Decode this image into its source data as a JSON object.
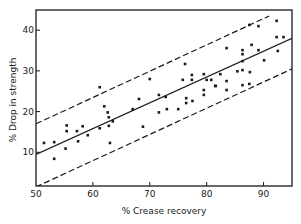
{
  "chart_data": {
    "type": "scatter",
    "title": "",
    "xlabel": "% Crease recovery",
    "ylabel": "% Drop in strength",
    "xlim": [
      50,
      95
    ],
    "ylim": [
      0,
      45
    ],
    "xticks": [
      50,
      60,
      70,
      80,
      90
    ],
    "yticks": [
      10,
      20,
      30,
      40
    ],
    "grid": false,
    "legend": null,
    "colors": {
      "ink": "#1a1a1a",
      "background": "#ffffff"
    },
    "series": [
      {
        "name": "observations",
        "kind": "points",
        "points": [
          [
            51.4,
            12.3
          ],
          [
            53.2,
            12.5
          ],
          [
            53.2,
            8.4
          ],
          [
            55.2,
            10.9
          ],
          [
            55.4,
            16.6
          ],
          [
            55.4,
            15.2
          ],
          [
            57.2,
            15.2
          ],
          [
            57.4,
            12.7
          ],
          [
            58.2,
            16.4
          ],
          [
            59.1,
            14.2
          ],
          [
            61.2,
            15.9
          ],
          [
            61.2,
            26.0
          ],
          [
            62.0,
            21.3
          ],
          [
            62.6,
            19.8
          ],
          [
            62.8,
            18.6
          ],
          [
            63.5,
            17.6
          ],
          [
            62.8,
            16.5
          ],
          [
            63.0,
            12.3
          ],
          [
            67.0,
            20.6
          ],
          [
            68.1,
            23.1
          ],
          [
            70.0,
            28.0
          ],
          [
            68.8,
            16.3
          ],
          [
            71.6,
            24.1
          ],
          [
            71.6,
            19.8
          ],
          [
            72.8,
            23.6
          ],
          [
            73.0,
            20.6
          ],
          [
            75.0,
            20.6
          ],
          [
            76.2,
            31.7
          ],
          [
            75.8,
            27.8
          ],
          [
            77.4,
            29.0
          ],
          [
            77.4,
            27.8
          ],
          [
            79.5,
            29.2
          ],
          [
            80.8,
            27.8
          ],
          [
            79.5,
            25.3
          ],
          [
            76.4,
            23.3
          ],
          [
            76.4,
            22.1
          ],
          [
            77.5,
            22.6
          ],
          [
            79.5,
            24.1
          ],
          [
            81.5,
            26.3
          ],
          [
            87.5,
            41.3
          ],
          [
            89.1,
            41.0
          ],
          [
            92.3,
            42.3
          ],
          [
            92.3,
            38.3
          ],
          [
            93.5,
            38.3
          ],
          [
            83.5,
            35.6
          ],
          [
            87.9,
            36.4
          ],
          [
            86.3,
            35.1
          ],
          [
            86.3,
            34.1
          ],
          [
            89.1,
            35.1
          ],
          [
            92.5,
            34.9
          ],
          [
            90.1,
            32.6
          ],
          [
            86.3,
            32.4
          ],
          [
            85.4,
            29.9
          ],
          [
            86.3,
            30.2
          ],
          [
            87.6,
            29.7
          ],
          [
            82.4,
            29.2
          ],
          [
            80.0,
            27.8
          ],
          [
            83.5,
            27.5
          ],
          [
            81.6,
            26.3
          ],
          [
            83.5,
            25.3
          ],
          [
            86.3,
            26.5
          ],
          [
            87.5,
            26.8
          ]
        ]
      },
      {
        "name": "regression line",
        "kind": "line",
        "style": "solid",
        "from": [
          50,
          9.5
        ],
        "to": [
          95,
          38.0
        ]
      },
      {
        "name": "upper confidence limit",
        "kind": "line",
        "style": "dashed",
        "from": [
          50,
          17.0
        ],
        "to": [
          91,
          43.5
        ]
      },
      {
        "name": "lower confidence limit",
        "kind": "line",
        "style": "dashed",
        "from": [
          50,
          1.5
        ],
        "to": [
          95,
          30.5
        ]
      }
    ]
  }
}
